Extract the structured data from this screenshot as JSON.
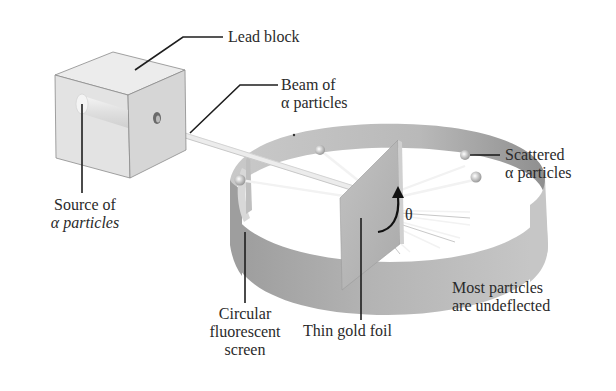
{
  "diagram": {
    "labels": {
      "lead_block": "Lead block",
      "beam_line1": "Beam of",
      "beam_line2": "α particles",
      "source_line1": "Source of",
      "source_line2": "α particles",
      "scattered_line1": "Scattered",
      "scattered_line2": "α particles",
      "theta": "θ",
      "screen_line1": "Circular",
      "screen_line2": "fluorescent",
      "screen_line3": "screen",
      "foil": "Thin gold foil",
      "undeflected_line1": "Most particles",
      "undeflected_line2": "are undeflected"
    },
    "components": [
      "lead block",
      "source of alpha particles",
      "beam of alpha particles",
      "thin gold foil",
      "circular fluorescent screen",
      "scattered alpha particles",
      "scattering angle theta"
    ],
    "colors": {
      "block_front": "#e2e2e2",
      "block_top": "#ececec",
      "block_side": "#d4d4d4",
      "ring_outer": "#a9a9a9",
      "ring_inner": "#bdbdbd",
      "foil": "#b8b8b8",
      "leader_line": "#222222"
    }
  }
}
